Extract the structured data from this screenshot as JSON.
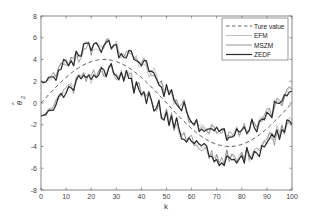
{
  "chart_data": {
    "type": "line",
    "title": "",
    "xlabel": "k",
    "ylabel": "θ̂₂",
    "xlim": [
      0,
      100
    ],
    "ylim": [
      -8,
      8
    ],
    "xticks": [
      0,
      10,
      20,
      30,
      40,
      50,
      60,
      70,
      80,
      90,
      100
    ],
    "yticks": [
      -8,
      -6,
      -4,
      -2,
      0,
      2,
      4,
      6,
      8
    ],
    "grid": false,
    "legend_position": "upper right",
    "true_value": {
      "name": "Ture value",
      "formula": "4*sin(2*pi*k/100)",
      "amplitude": 4,
      "period": 100,
      "style": "dashed",
      "color": "#555555"
    },
    "bands": {
      "upper_offset": 1.2,
      "lower_offset": -1.2,
      "noise_amplitude": 0.6
    },
    "series": [
      {
        "name": "Ture value",
        "style": "dashed",
        "color": "#555555",
        "width": 1.0
      },
      {
        "name": "EFM",
        "style": "solid",
        "color": "#b0b0b0",
        "width": 0.7
      },
      {
        "name": "MSZM",
        "style": "solid",
        "color": "#777777",
        "width": 0.7
      },
      {
        "name": "ZEDF",
        "style": "solid",
        "color": "#2a2a2a",
        "width": 1.2
      }
    ],
    "approx_values": {
      "k": [
        0,
        10,
        20,
        25,
        30,
        40,
        50,
        60,
        70,
        75,
        80,
        90,
        100
      ],
      "true": [
        0,
        2.35,
        3.8,
        4.0,
        3.8,
        2.35,
        0,
        -2.35,
        -3.8,
        -4.0,
        -3.8,
        -2.35,
        0
      ],
      "upper_band": [
        2.0,
        3.0,
        4.8,
        5.0,
        5.0,
        3.5,
        1.2,
        -1.2,
        -2.6,
        -2.8,
        -2.6,
        -1.0,
        0.8
      ],
      "lower_band": [
        -1.0,
        0.8,
        2.8,
        3.0,
        2.8,
        1.2,
        -1.2,
        -3.5,
        -5.0,
        -5.0,
        -4.8,
        -3.0,
        -1.4
      ]
    }
  },
  "plot": {
    "x_min_label": "0"
  },
  "legend": {
    "items": [
      "Ture value",
      "EFM",
      "MSZM",
      "ZEDF"
    ]
  },
  "axes": {
    "xlabel": "k",
    "ylabel_main": "θ",
    "ylabel_sub": "2"
  }
}
